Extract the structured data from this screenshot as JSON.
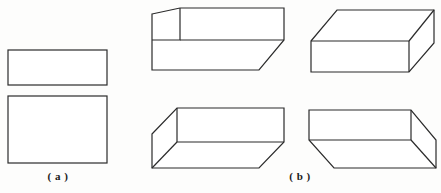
{
  "figure": {
    "background_color": "#fdfdfc",
    "stroke_color": "#2b2b2b",
    "fill_color": "#ffffff",
    "stroke_width": 1.2,
    "width": 441,
    "height": 193
  },
  "panels": [
    {
      "id": "a",
      "caption": "( a )",
      "description": "two plain 2D rectangles stacked vertically",
      "shapes": [
        {
          "name": "rectangle-upper",
          "type": "rectangle",
          "x": 8,
          "y": 50,
          "width": 99,
          "height": 35
        },
        {
          "name": "rectangle-lower",
          "type": "rectangle",
          "x": 8,
          "y": 96,
          "width": 99,
          "height": 67
        }
      ]
    },
    {
      "id": "b",
      "caption": "( b )",
      "description": "four 3D box line drawings in a 2x2 arrangement",
      "shapes": [
        {
          "name": "box-top-left",
          "type": "box",
          "view": "above-left",
          "outline": "152,14 180,8 284,8 284,40 259,70 152,70",
          "edges": [
            "152,40 259,40",
            "259,40 259,70",
            "152,40 180,8",
            "259,40 284,8"
          ]
        },
        {
          "name": "box-top-right",
          "type": "box",
          "view": "above-right",
          "outline": "311,41 337,10 434,10 434,43 409,72 311,72",
          "edges": [
            "409,41 409,72",
            "311,41 409,41",
            "409,41 434,10",
            "311,41 337,10"
          ]
        },
        {
          "name": "box-bottom-left",
          "type": "box",
          "view": "below-left",
          "outline": "152,134 177,108 284,108 284,142 259,168 152,168",
          "edges": [
            "177,108 177,142",
            "177,142 284,142",
            "177,142 152,168",
            "284,142 259,168"
          ]
        },
        {
          "name": "box-bottom-right",
          "type": "box",
          "view": "below-right",
          "outline": "309,110 411,110 436,140 436,168 334,168 309,140",
          "edges": [
            "309,140 411,140",
            "411,110 411,140",
            "411,140 436,168",
            "309,140 334,168"
          ]
        }
      ]
    }
  ]
}
